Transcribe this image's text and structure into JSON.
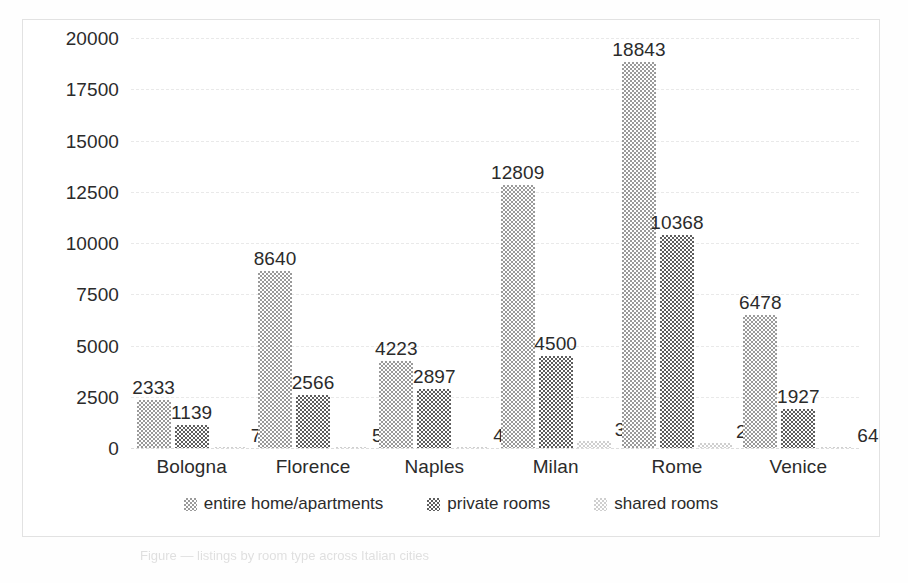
{
  "chart_data": {
    "type": "bar",
    "title": "",
    "xlabel": "",
    "ylabel": "",
    "grid": true,
    "legend_position": "bottom",
    "ylim": [
      0,
      20000
    ],
    "yticks": [
      20000,
      17500,
      15000,
      12500,
      10000,
      7500,
      5000,
      2500,
      0
    ],
    "ytick_labels": [
      "20000",
      "17500",
      "15000",
      "12500",
      "10000",
      "7500",
      "5000",
      "2500",
      "0"
    ],
    "categories": [
      "Bologna",
      "Florence",
      "Naples",
      "Milan",
      "Rome",
      "Venice"
    ],
    "series": [
      {
        "name": "entire home/apartments",
        "values": [
          2333,
          8640,
          4223,
          12809,
          18843,
          6478
        ],
        "labels": [
          "2333",
          "8640",
          "4223",
          "12809",
          "18843",
          "6478"
        ],
        "color": "#9a9a9a"
      },
      {
        "name": "private rooms",
        "values": [
          1139,
          2566,
          2897,
          4500,
          10368,
          1927
        ],
        "labels": [
          "1139",
          "2566",
          "2897",
          "4500",
          "10368",
          "1927"
        ],
        "color": "#5e5e5e"
      },
      {
        "name": "shared rooms",
        "values": [
          70,
          56,
          49,
          350,
          225,
          64
        ],
        "labels": [
          "70",
          "56",
          "49",
          "350",
          "225",
          "64"
        ],
        "color": "#cfcfcf"
      }
    ]
  },
  "legend": {
    "items": [
      {
        "label": "entire home/apartments",
        "swatch": "legend-swatch-entire-home"
      },
      {
        "label": "private rooms",
        "swatch": "legend-swatch-private-rooms"
      },
      {
        "label": "shared rooms",
        "swatch": "legend-swatch-shared-rooms"
      }
    ]
  },
  "caption_artifact": "Figure — listings by room type across Italian cities"
}
